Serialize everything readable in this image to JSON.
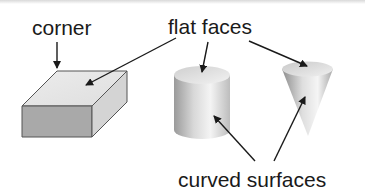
{
  "labels": {
    "corner": "corner",
    "flat_faces": "flat faces",
    "curved_surfaces": "curved surfaces"
  },
  "shapes": [
    "rectangular prism",
    "cylinder",
    "cone"
  ],
  "colors": {
    "text": "#1a1a1a",
    "arrow": "#1a1a1a",
    "box_top": "#e6e6e6",
    "box_front": "#a9a9a9",
    "box_side": "#d2d2d2"
  }
}
